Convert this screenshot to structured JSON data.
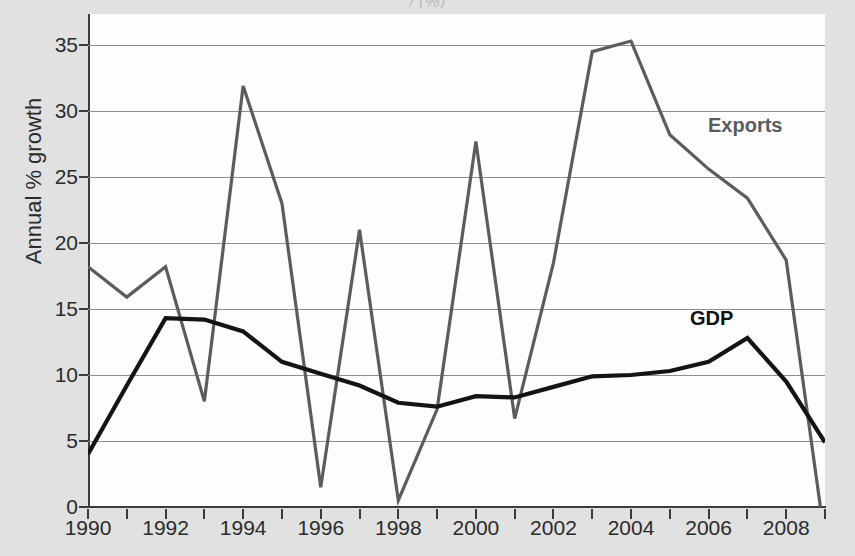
{
  "figure": {
    "cut_title": "/                                                  (%)",
    "background_color": "#d7d7d7",
    "plot_background_color": "#fdfdfd"
  },
  "chart_data": {
    "type": "line",
    "title": "",
    "xlabel": "",
    "ylabel": "Annual % growth",
    "xlim": [
      1990,
      2009
    ],
    "ylim": [
      0,
      37.5
    ],
    "grid": true,
    "grid_axis": "y",
    "legend_position": "inline-annotation",
    "y_ticks": [
      0,
      5,
      10,
      15,
      20,
      25,
      30,
      35
    ],
    "y_tick_labels": [
      "0",
      "5",
      "10",
      "15",
      "20",
      "25",
      "30",
      "35"
    ],
    "x_ticks": [
      1990,
      1991,
      1992,
      1993,
      1994,
      1995,
      1996,
      1997,
      1998,
      1999,
      2000,
      2001,
      2002,
      2003,
      2004,
      2005,
      2006,
      2007,
      2008,
      2009
    ],
    "x_tick_labels": [
      "1990",
      "",
      "1992",
      "",
      "1994",
      "",
      "1996",
      "",
      "1998",
      "",
      "2000",
      "",
      "2002",
      "",
      "2004",
      "",
      "2006",
      "",
      "2008",
      ""
    ],
    "x_labeled_ticks": [
      {
        "value": 1990,
        "label": "1990"
      },
      {
        "value": 1992,
        "label": "1992"
      },
      {
        "value": 1994,
        "label": "1994"
      },
      {
        "value": 1996,
        "label": "1996"
      },
      {
        "value": 1998,
        "label": "1998"
      },
      {
        "value": 2000,
        "label": "2000"
      },
      {
        "value": 2002,
        "label": "2002"
      },
      {
        "value": 2004,
        "label": "2004"
      },
      {
        "value": 2006,
        "label": "2006"
      },
      {
        "value": 2008,
        "label": "2008"
      }
    ],
    "x": [
      1990,
      1991,
      1992,
      1993,
      1994,
      1995,
      1996,
      1997,
      1998,
      1999,
      2000,
      2001,
      2002,
      2003,
      2004,
      2005,
      2006,
      2007,
      2008,
      2009
    ],
    "series": [
      {
        "name": "Exports",
        "color": "#5c5c5c",
        "label_text": "Exports",
        "values": [
          18.2,
          15.9,
          18.2,
          8.0,
          31.9,
          23.0,
          1.5,
          21.0,
          0.5,
          7.4,
          27.7,
          6.7,
          18.5,
          34.5,
          35.3,
          28.2,
          25.6,
          23.4,
          18.7,
          -2.5
        ]
      },
      {
        "name": "GDP",
        "color": "#141414",
        "label_text": "GDP",
        "values": [
          4.0,
          9.2,
          14.3,
          14.2,
          13.3,
          11.0,
          10.1,
          9.2,
          7.9,
          7.6,
          8.4,
          8.3,
          9.1,
          9.9,
          10.0,
          10.3,
          11.0,
          12.8,
          9.5,
          4.9
        ]
      }
    ]
  }
}
